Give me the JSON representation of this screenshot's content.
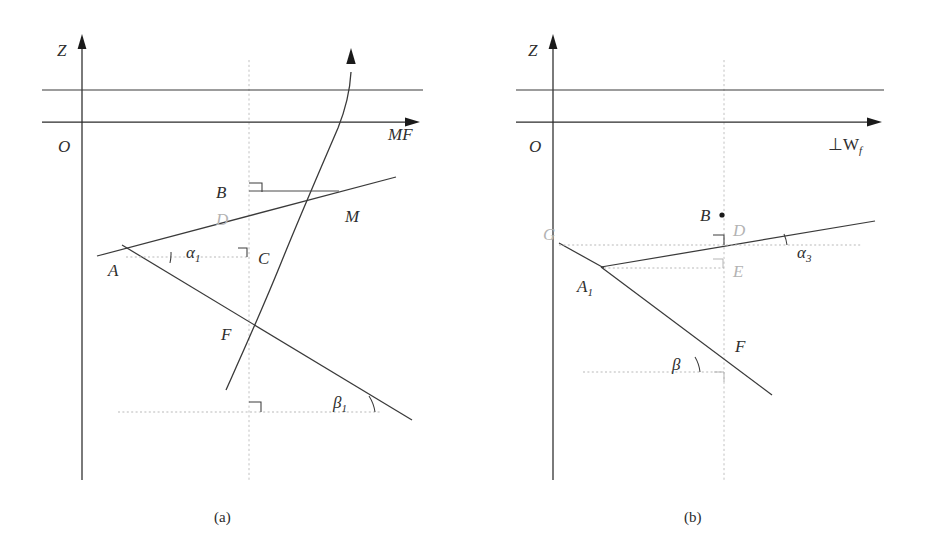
{
  "figure": {
    "panels": [
      {
        "id": "a",
        "caption": "(a)",
        "axes": {
          "vertical_label": "Z",
          "origin_label": "O",
          "horizontal_label": "MF"
        },
        "points": [
          {
            "name": "B",
            "label": "B",
            "faint": false
          },
          {
            "name": "D",
            "label": "D",
            "faint": true
          },
          {
            "name": "M",
            "label": "M",
            "faint": false
          },
          {
            "name": "C",
            "label": "C",
            "faint": false
          },
          {
            "name": "A",
            "label": "A",
            "faint": false
          },
          {
            "name": "F",
            "label": "F",
            "faint": false
          }
        ],
        "angles": [
          {
            "name": "alpha1",
            "symbol": "α",
            "subscript": "1"
          },
          {
            "name": "beta1",
            "symbol": "β",
            "subscript": "1"
          }
        ]
      },
      {
        "id": "b",
        "caption": "(b)",
        "axes": {
          "vertical_label": "Z",
          "origin_label": "O",
          "horizontal_label": "⊥W",
          "horizontal_label_subscript": "f"
        },
        "points": [
          {
            "name": "G",
            "label": "G",
            "faint": true
          },
          {
            "name": "B",
            "label": "B",
            "faint": false
          },
          {
            "name": "D",
            "label": "D",
            "faint": true
          },
          {
            "name": "E",
            "label": "E",
            "faint": true
          },
          {
            "name": "A1",
            "label": "A",
            "subscript": "1",
            "faint": false
          },
          {
            "name": "F",
            "label": "F",
            "faint": false
          }
        ],
        "angles": [
          {
            "name": "alpha3",
            "symbol": "α",
            "subscript": "3"
          },
          {
            "name": "beta",
            "symbol": "β",
            "subscript": ""
          }
        ]
      }
    ]
  }
}
